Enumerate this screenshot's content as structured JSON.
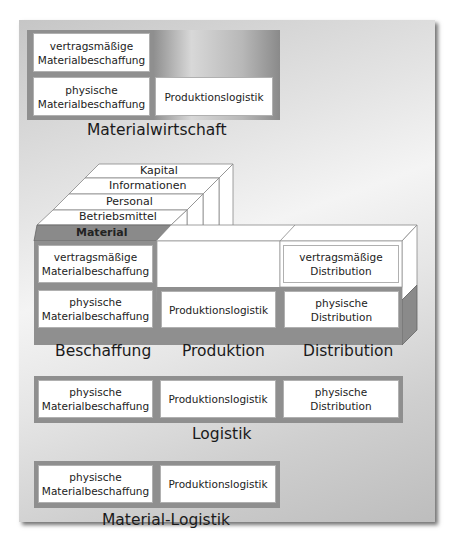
{
  "materialwirtschaft": {
    "title": "Materialwirtschaft",
    "cells": [
      {
        "line1": "vertragsmäßige",
        "line2": "Materialbeschaffung"
      },
      {
        "line1": "physische",
        "line2": "Materialbeschaffung"
      },
      {
        "line1": "Produktionslogistik",
        "line2": ""
      }
    ]
  },
  "cube": {
    "layers": [
      "Kapital",
      "Informationen",
      "Personal",
      "Betriebsmittel",
      "Material"
    ],
    "columns": [
      {
        "title": "Beschaffung",
        "top": {
          "line1": "vertragsmäßige",
          "line2": "Materialbeschaffung"
        },
        "bottom": {
          "line1": "physische",
          "line2": "Materialbeschaffung"
        }
      },
      {
        "title": "Produktion",
        "top": {
          "line1": "",
          "line2": ""
        },
        "bottom": {
          "line1": "Produktionslogistik",
          "line2": ""
        }
      },
      {
        "title": "Distribution",
        "top": {
          "line1": "vertragsmäßige",
          "line2": "Distribution"
        },
        "bottom": {
          "line1": "physische",
          "line2": "Distribution"
        }
      }
    ]
  },
  "logistik": {
    "title": "Logistik",
    "cells": [
      {
        "line1": "physische",
        "line2": "Materialbeschaffung"
      },
      {
        "line1": "Produktionslogistik",
        "line2": ""
      },
      {
        "line1": "physische",
        "line2": "Distribution"
      }
    ]
  },
  "material_logistik": {
    "title": "Material-Logistik",
    "cells": [
      {
        "line1": "physische",
        "line2": "Materialbeschaffung"
      },
      {
        "line1": "Produktionslogistik",
        "line2": ""
      }
    ]
  },
  "colors": {
    "group_border": "#8f8f8f",
    "material_fill": "#8a8a8a",
    "cell_fill": "#ffffff"
  }
}
